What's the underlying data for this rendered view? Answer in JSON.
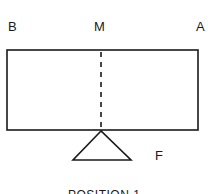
{
  "diagram": {
    "labels": {
      "left_end": "B",
      "midpoint": "M",
      "right_end": "A",
      "fulcrum": "F"
    },
    "caption": "POSITION 1",
    "colors": {
      "stroke": "#1a1a1a",
      "background": "#ffffff"
    }
  }
}
